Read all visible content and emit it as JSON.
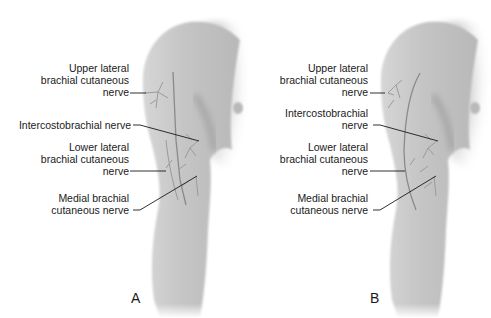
{
  "figure": {
    "panels": [
      {
        "id": "A",
        "letter": "A",
        "labels": {
          "upper_lateral": [
            "Upper lateral",
            "brachial cutaneous",
            "nerve"
          ],
          "intercostobrachial": [
            "Intercostobrachial nerve"
          ],
          "lower_lateral": [
            "Lower lateral",
            "brachial cutaneous",
            "nerve"
          ],
          "medial": [
            "Medial brachial",
            "cutaneous nerve"
          ]
        }
      },
      {
        "id": "B",
        "letter": "B",
        "labels": {
          "upper_lateral": [
            "Upper lateral",
            "brachial cutaneous",
            "nerve"
          ],
          "intercostobrachial": [
            "Intercostobrachial",
            "nerve"
          ],
          "lower_lateral": [
            "Lower lateral",
            "brachial cutaneous",
            "nerve"
          ],
          "medial": [
            "Medial brachial",
            "cutaneous nerve"
          ]
        }
      }
    ],
    "colors": {
      "skin": "#c8c8c8",
      "skin_dark": "#a9a9a9",
      "nerve": "#8a8a8a",
      "leader": "#1a1a1a",
      "text": "#1a1a1a"
    }
  }
}
